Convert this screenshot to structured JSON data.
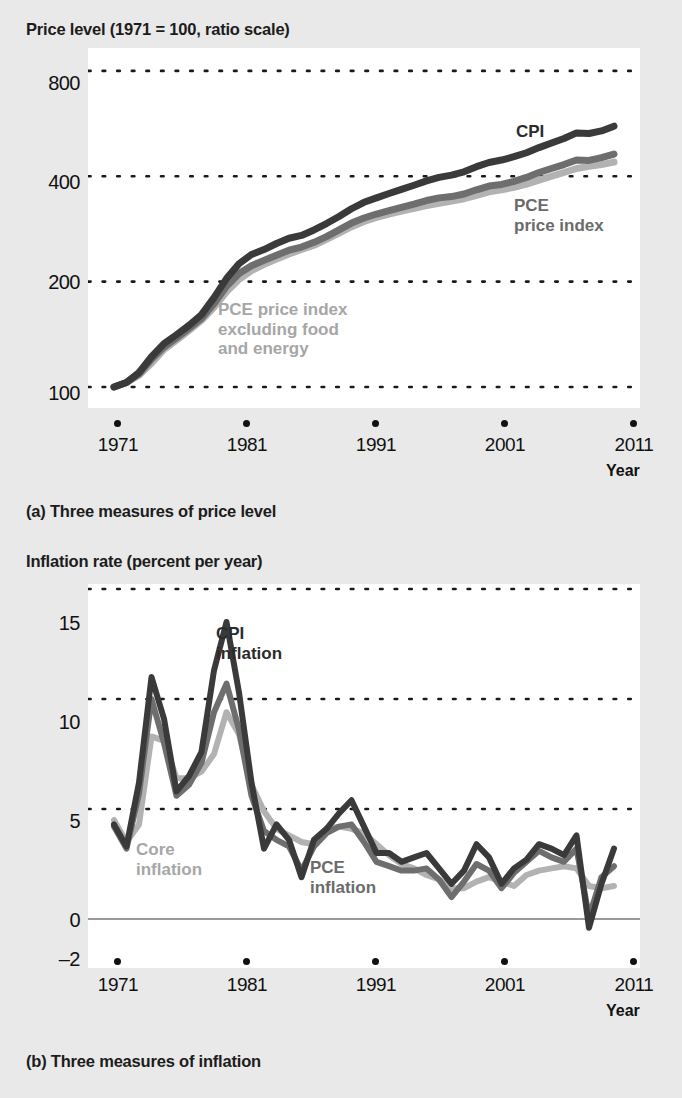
{
  "figure": {
    "background_color": "#e9e9e9",
    "plot_background_color": "#ffffff"
  },
  "colors": {
    "cpi": "#3a3a3a",
    "pce": "#6e6e6e",
    "core": "#b2b2b2",
    "gridline": "#1a1a1a",
    "zero_line": "#9a9a9a",
    "text": "#111111"
  },
  "panel_a": {
    "axis_title": "Price level (1971 = 100, ratio scale)",
    "caption": "(a) Three measures of price level",
    "x_axis_label": "Year",
    "y_ticks": [
      "800",
      "400",
      "200",
      "100"
    ],
    "x_ticks": [
      "1971",
      "1981",
      "1991",
      "2001",
      "2011"
    ],
    "series_labels": {
      "cpi": "CPI",
      "pce_line1": "PCE",
      "pce_line2": "price index",
      "core_line1": "PCE price index",
      "core_line2": "excluding food",
      "core_line3": "and energy"
    }
  },
  "panel_b": {
    "axis_title": "Inflation rate (percent per year)",
    "caption": "(b) Three measures of inflation",
    "x_axis_label": "Year",
    "y_ticks": [
      "15",
      "10",
      "5",
      "0",
      "–2"
    ],
    "x_ticks": [
      "1971",
      "1981",
      "1991",
      "2001",
      "2011"
    ],
    "series_labels": {
      "cpi_line1": "CPI",
      "cpi_line2": "inflation",
      "core_line1": "Core",
      "core_line2": "inflation",
      "pce_line1": "PCE",
      "pce_line2": "inflation"
    }
  },
  "chart_data": [
    {
      "type": "line",
      "title": "Price level (1971 = 100, ratio scale)",
      "subtitle": "(a) Three measures of price level",
      "xlabel": "Year",
      "ylabel": "Price level (1971 = 100)",
      "yscale": "log",
      "ylim": [
        90,
        900
      ],
      "ytick_values": [
        100,
        200,
        400,
        800
      ],
      "xlim": [
        1971,
        2011
      ],
      "xtick_values": [
        1971,
        1981,
        1991,
        2001,
        2011
      ],
      "grid": "horizontal-dotted",
      "legend": "inline-annotations",
      "x": [
        1971,
        1972,
        1973,
        1974,
        1975,
        1976,
        1977,
        1978,
        1979,
        1980,
        1981,
        1982,
        1983,
        1984,
        1985,
        1986,
        1987,
        1988,
        1989,
        1990,
        1991,
        1992,
        1993,
        1994,
        1995,
        1996,
        1997,
        1998,
        1999,
        2000,
        2001,
        2002,
        2003,
        2004,
        2005,
        2006,
        2007,
        2008,
        2009,
        2010,
        2011
      ],
      "series": [
        {
          "name": "CPI",
          "color": "#3a3a3a",
          "values": [
            100,
            103,
            110,
            122,
            133,
            141,
            150,
            161,
            180,
            204,
            225,
            239,
            247,
            257,
            266,
            271,
            281,
            293,
            307,
            323,
            337,
            347,
            357,
            367,
            377,
            388,
            397,
            403,
            412,
            426,
            438,
            445,
            455,
            467,
            483,
            498,
            513,
            532,
            530,
            539,
            556
          ]
        },
        {
          "name": "PCE price index",
          "color": "#6e6e6e",
          "values": [
            100,
            103,
            109,
            120,
            130,
            138,
            147,
            157,
            173,
            194,
            211,
            222,
            230,
            238,
            246,
            251,
            259,
            269,
            281,
            294,
            304,
            312,
            319,
            326,
            333,
            341,
            347,
            350,
            356,
            366,
            375,
            379,
            387,
            397,
            410,
            421,
            432,
            445,
            444,
            452,
            463
          ]
        },
        {
          "name": "PCE price index excluding food and energy",
          "color": "#b2b2b2",
          "values": [
            100,
            103,
            108,
            117,
            128,
            136,
            145,
            155,
            169,
            187,
            203,
            215,
            224,
            232,
            240,
            247,
            254,
            264,
            275,
            287,
            297,
            305,
            312,
            318,
            324,
            330,
            335,
            340,
            345,
            353,
            361,
            366,
            372,
            380,
            390,
            400,
            410,
            421,
            427,
            432,
            439
          ]
        }
      ]
    },
    {
      "type": "line",
      "title": "Inflation rate (percent per year)",
      "subtitle": "(b) Three measures of inflation",
      "xlabel": "Year",
      "ylabel": "Inflation rate (percent per year)",
      "yscale": "linear",
      "ylim": [
        -2,
        15
      ],
      "ytick_values": [
        -2,
        0,
        5,
        10,
        15
      ],
      "xlim": [
        1971,
        2011
      ],
      "xtick_values": [
        1971,
        1981,
        1991,
        2001,
        2011
      ],
      "grid": "horizontal-dotted",
      "zero_line": 0,
      "legend": "inline-annotations",
      "x": [
        1971,
        1972,
        1973,
        1974,
        1975,
        1976,
        1977,
        1978,
        1979,
        1980,
        1981,
        1982,
        1983,
        1984,
        1985,
        1986,
        1987,
        1988,
        1989,
        1990,
        1991,
        1992,
        1993,
        1994,
        1995,
        1996,
        1997,
        1998,
        1999,
        2000,
        2001,
        2002,
        2003,
        2004,
        2005,
        2006,
        2007,
        2008,
        2009,
        2010,
        2011
      ],
      "series": [
        {
          "name": "CPI inflation",
          "color": "#3a3a3a",
          "values": [
            4.3,
            3.3,
            6.2,
            11.0,
            9.1,
            5.8,
            6.5,
            7.6,
            11.3,
            13.5,
            10.3,
            6.2,
            3.2,
            4.3,
            3.6,
            1.9,
            3.6,
            4.1,
            4.8,
            5.4,
            4.2,
            3.0,
            3.0,
            2.6,
            2.8,
            3.0,
            2.3,
            1.6,
            2.2,
            3.4,
            2.8,
            1.6,
            2.3,
            2.7,
            3.4,
            3.2,
            2.9,
            3.8,
            -0.4,
            1.6,
            3.2
          ]
        },
        {
          "name": "PCE inflation",
          "color": "#6e6e6e",
          "values": [
            4.2,
            3.2,
            5.7,
            10.0,
            8.0,
            5.6,
            6.1,
            7.1,
            9.4,
            10.7,
            8.6,
            5.6,
            4.0,
            3.6,
            3.3,
            2.2,
            3.3,
            3.9,
            4.2,
            4.3,
            3.5,
            2.6,
            2.4,
            2.2,
            2.2,
            2.3,
            1.8,
            1.0,
            1.7,
            2.5,
            2.2,
            1.4,
            2.1,
            2.6,
            3.1,
            2.8,
            2.6,
            3.2,
            0.1,
            1.9,
            2.4
          ]
        },
        {
          "name": "Core inflation",
          "color": "#b2b2b2",
          "values": [
            4.5,
            3.5,
            4.3,
            8.3,
            8.1,
            6.4,
            6.4,
            6.7,
            7.5,
            9.4,
            8.4,
            6.1,
            4.9,
            4.1,
            3.8,
            3.5,
            3.4,
            4.1,
            4.2,
            4.1,
            3.9,
            3.4,
            2.9,
            2.5,
            2.3,
            2.0,
            1.8,
            1.4,
            1.4,
            1.7,
            1.9,
            1.7,
            1.5,
            2.0,
            2.2,
            2.3,
            2.4,
            2.3,
            1.5,
            1.4,
            1.5
          ]
        }
      ]
    }
  ]
}
